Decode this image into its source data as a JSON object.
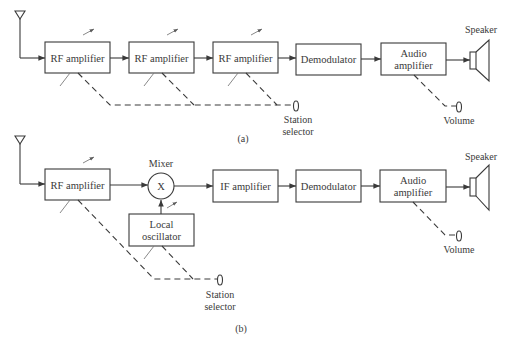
{
  "diagram_a": {
    "caption": "(a)",
    "blocks": [
      {
        "id": "rf1",
        "label": "RF amplifier"
      },
      {
        "id": "rf2",
        "label": "RF amplifier"
      },
      {
        "id": "rf3",
        "label": "RF amplifier"
      },
      {
        "id": "demod",
        "label": "Demodulator"
      },
      {
        "id": "audio",
        "line1": "Audio",
        "line2": "amplifier"
      }
    ],
    "speaker_label": "Speaker",
    "station_selector": {
      "line1": "Station",
      "line2": "selector"
    },
    "volume_label": "Volume"
  },
  "diagram_b": {
    "caption": "(b)",
    "blocks": [
      {
        "id": "rf",
        "label": "RF amplifier"
      },
      {
        "id": "mixer",
        "label": "Mixer",
        "symbol": "X"
      },
      {
        "id": "lo",
        "line1": "Local",
        "line2": "oscillator"
      },
      {
        "id": "if",
        "label": "IF amplifier"
      },
      {
        "id": "demod",
        "label": "Demodulator"
      },
      {
        "id": "audio",
        "line1": "Audio",
        "line2": "amplifier"
      }
    ],
    "speaker_label": "Speaker",
    "station_selector": {
      "line1": "Station",
      "line2": "selector"
    },
    "volume_label": "Volume"
  },
  "colors": {
    "stroke": "#3a3a3a",
    "background": "#ffffff"
  }
}
